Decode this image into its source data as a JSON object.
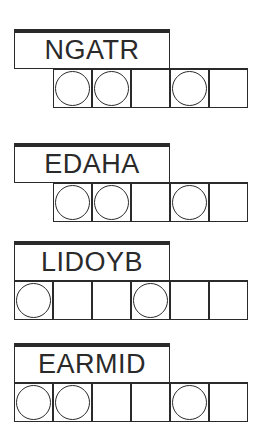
{
  "puzzles": [
    {
      "scrambled": "NGATR",
      "top": 29,
      "cells_left": 53,
      "cells": [
        true,
        true,
        false,
        true,
        false
      ]
    },
    {
      "scrambled": "EDAHA",
      "top": 143,
      "cells_left": 53,
      "cells": [
        true,
        true,
        false,
        true,
        false
      ]
    },
    {
      "scrambled": "LIDOYB",
      "top": 241,
      "cells_left": 14,
      "cells": [
        true,
        false,
        false,
        true,
        false,
        false
      ]
    },
    {
      "scrambled": "EARMID",
      "top": 343,
      "cells_left": 14,
      "cells": [
        true,
        true,
        false,
        false,
        true,
        false
      ]
    }
  ]
}
